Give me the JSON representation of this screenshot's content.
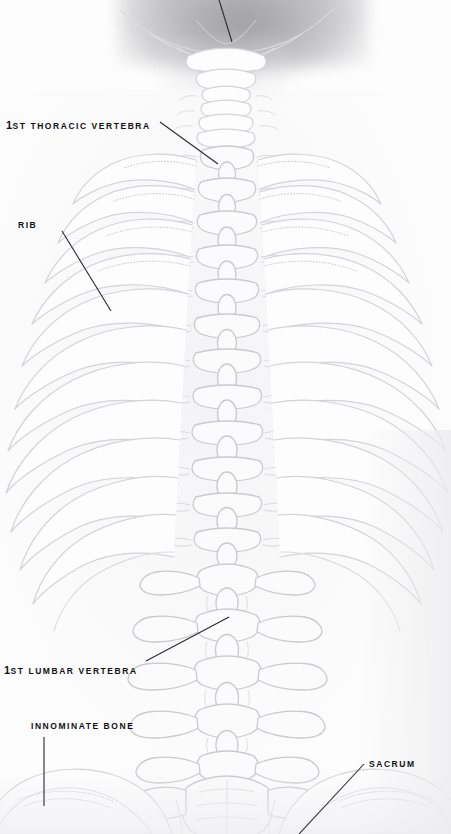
{
  "figure": {
    "view": "posterior",
    "style": "faded medical line illustration"
  },
  "labels": [
    {
      "id": "thoracic",
      "ordinal": "1",
      "suffix": "ST",
      "text": "THORACIC VERTEBRA",
      "full_text": "1ST THORACIC VERTEBRA",
      "leader": {
        "x1": 160,
        "y1": 122,
        "x2": 218,
        "y2": 164
      }
    },
    {
      "id": "rib",
      "ordinal": "",
      "suffix": "",
      "text": "RIB",
      "full_text": "RIB",
      "leader": {
        "x1": 62,
        "y1": 231,
        "x2": 111,
        "y2": 311
      }
    },
    {
      "id": "lumbar",
      "ordinal": "1",
      "suffix": "ST",
      "text": "LUMBAR VERTEBRA",
      "full_text": "1ST LUMBAR VERTEBRA",
      "leader": {
        "x1": 146,
        "y1": 661,
        "x2": 229,
        "y2": 617
      }
    },
    {
      "id": "innominate",
      "ordinal": "",
      "suffix": "",
      "text": "INNOMINATE BONE",
      "full_text": "INNOMINATE BONE",
      "leader": {
        "x1": 44,
        "y1": 737,
        "x2": 44,
        "y2": 806
      }
    },
    {
      "id": "sacrum",
      "ordinal": "",
      "suffix": "",
      "text": "SACRUM",
      "full_text": "SACRUM",
      "leader": {
        "x1": 299,
        "y1": 834,
        "x2": 364,
        "y2": 764
      }
    },
    {
      "id": "skull-top",
      "ordinal": "",
      "suffix": "",
      "text": "",
      "full_text": "",
      "leader": {
        "x1": 216,
        "y1": -10,
        "x2": 232,
        "y2": 42
      }
    }
  ],
  "colors": {
    "bone_stroke": "#d4d4d8",
    "bone_stroke_dark": "#c6c6cb",
    "bone_fill": "#fcfcfd",
    "label_text": "#111114",
    "leader_line": "#2a2a2e",
    "background": "#ffffff",
    "skull_shadow": "#a0a0a4"
  },
  "anatomy": {
    "thoracic_vertebrae_count": 12,
    "lumbar_vertebrae_count": 5,
    "rib_pairs_visible": 12,
    "regions": [
      "skull base",
      "cervical spine",
      "thoracic spine",
      "rib cage",
      "lumbar spine",
      "sacrum",
      "innominate bone"
    ]
  }
}
